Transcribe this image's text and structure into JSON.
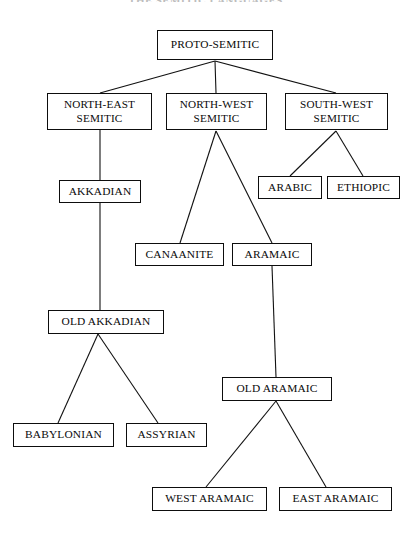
{
  "figure": {
    "title": "THE SEMITIC LANGUAGES",
    "type": "tree-diagram",
    "colors": {
      "background": "#ffffff",
      "box_border": "#0d0d0d",
      "connector": "#111111",
      "text": "#0a0a0a"
    }
  },
  "nodes": [
    {
      "id": "proto-semitic",
      "label": "PROTO-SEMITIC",
      "x": 157,
      "y": 30,
      "w": 116,
      "h": 30,
      "level": 0
    },
    {
      "id": "north-east",
      "label": "NORTH-EAST\nSEMITIC",
      "x": 47,
      "y": 93,
      "w": 105,
      "h": 37,
      "level": 1
    },
    {
      "id": "north-west",
      "label": "NORTH-WEST\nSEMITIC",
      "x": 166,
      "y": 93,
      "w": 101,
      "h": 37,
      "level": 1
    },
    {
      "id": "south-west",
      "label": "SOUTH-WEST\nSEMITIC",
      "x": 285,
      "y": 93,
      "w": 103,
      "h": 37,
      "level": 1
    },
    {
      "id": "akkadian",
      "label": "AKKADIAN",
      "x": 59,
      "y": 180,
      "w": 82,
      "h": 23,
      "level": 2
    },
    {
      "id": "arabic",
      "label": "ARABIC",
      "x": 258,
      "y": 176,
      "w": 64,
      "h": 23,
      "level": 2
    },
    {
      "id": "ethiopic",
      "label": "ETHIOPIC",
      "x": 327,
      "y": 176,
      "w": 73,
      "h": 23,
      "level": 2
    },
    {
      "id": "canaanite",
      "label": "CANAANITE",
      "x": 135,
      "y": 243,
      "w": 89,
      "h": 23,
      "level": 3
    },
    {
      "id": "aramaic",
      "label": "ARAMAIC",
      "x": 232,
      "y": 243,
      "w": 80,
      "h": 23,
      "level": 3
    },
    {
      "id": "old-akkadian",
      "label": "OLD AKKADIAN",
      "x": 48,
      "y": 310,
      "w": 116,
      "h": 24,
      "level": 4
    },
    {
      "id": "old-aramaic",
      "label": "OLD ARAMAIC",
      "x": 222,
      "y": 377,
      "w": 110,
      "h": 24,
      "level": 5
    },
    {
      "id": "babylonian",
      "label": "BABYLONIAN",
      "x": 13,
      "y": 423,
      "w": 101,
      "h": 24,
      "level": 6
    },
    {
      "id": "assyrian",
      "label": "ASSYRIAN",
      "x": 126,
      "y": 423,
      "w": 81,
      "h": 24,
      "level": 6
    },
    {
      "id": "west-aramaic",
      "label": "WEST ARAMAIC",
      "x": 152,
      "y": 487,
      "w": 115,
      "h": 24,
      "level": 7
    },
    {
      "id": "east-aramaic",
      "label": "EAST ARAMAIC",
      "x": 279,
      "y": 487,
      "w": 113,
      "h": 24,
      "level": 7
    }
  ],
  "edges": [
    {
      "from": "proto-semitic",
      "to": "north-east",
      "x1": 215,
      "y1": 61,
      "x2": 100,
      "y2": 93
    },
    {
      "from": "proto-semitic",
      "to": "north-west",
      "x1": 215,
      "y1": 61,
      "x2": 216,
      "y2": 93
    },
    {
      "from": "proto-semitic",
      "to": "south-west",
      "x1": 215,
      "y1": 61,
      "x2": 336,
      "y2": 93
    },
    {
      "from": "north-east",
      "to": "akkadian",
      "x1": 100,
      "y1": 130,
      "x2": 100,
      "y2": 180
    },
    {
      "from": "south-west",
      "to": "arabic",
      "x1": 336,
      "y1": 131,
      "x2": 290,
      "y2": 176
    },
    {
      "from": "south-west",
      "to": "ethiopic",
      "x1": 336,
      "y1": 131,
      "x2": 363,
      "y2": 176
    },
    {
      "from": "north-west",
      "to": "canaanite",
      "x1": 216,
      "y1": 131,
      "x2": 180,
      "y2": 243
    },
    {
      "from": "north-west",
      "to": "aramaic",
      "x1": 216,
      "y1": 131,
      "x2": 272,
      "y2": 243
    },
    {
      "from": "akkadian",
      "to": "old-akkadian",
      "x1": 100,
      "y1": 203,
      "x2": 100,
      "y2": 310
    },
    {
      "from": "aramaic",
      "to": "old-aramaic",
      "x1": 272,
      "y1": 266,
      "x2": 276,
      "y2": 377
    },
    {
      "from": "old-akkadian",
      "to": "babylonian",
      "x1": 98,
      "y1": 334,
      "x2": 58,
      "y2": 423
    },
    {
      "from": "old-akkadian",
      "to": "assyrian",
      "x1": 98,
      "y1": 334,
      "x2": 158,
      "y2": 423
    },
    {
      "from": "old-aramaic",
      "to": "west-aramaic",
      "x1": 276,
      "y1": 401,
      "x2": 206,
      "y2": 487
    },
    {
      "from": "old-aramaic",
      "to": "east-aramaic",
      "x1": 276,
      "y1": 401,
      "x2": 326,
      "y2": 487
    }
  ]
}
